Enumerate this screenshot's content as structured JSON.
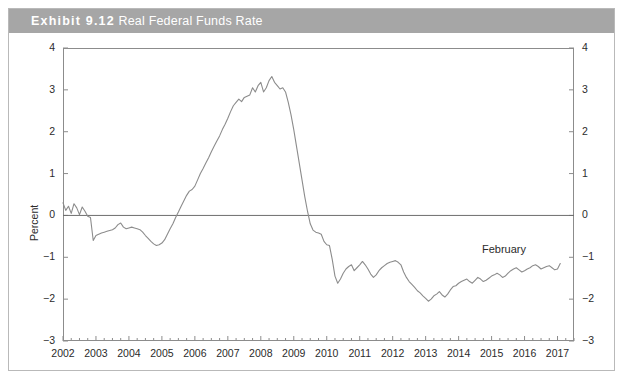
{
  "figure": {
    "exhibit_number": "Exhibit 9.12",
    "exhibit_title": "Real Federal Funds Rate",
    "border_color": "#b9b9b9",
    "title_bar_color": "#a6a6a6",
    "title_text_color": "#ffffff"
  },
  "annotations": {
    "february": "February"
  },
  "chart_data": {
    "type": "line",
    "title": "Real Federal Funds Rate",
    "xlabel": "",
    "ylabel": "Percent",
    "xlim": [
      2002.0,
      2017.5
    ],
    "ylim": [
      -3,
      4
    ],
    "yticks": [
      -3,
      -2,
      -1,
      0,
      1,
      2,
      3,
      4
    ],
    "ytick_labels": [
      "−3",
      "−2",
      "−1",
      "0",
      "1",
      "2",
      "3",
      "4"
    ],
    "xticks": [
      2002,
      2003,
      2004,
      2005,
      2006,
      2007,
      2008,
      2009,
      2010,
      2011,
      2012,
      2013,
      2014,
      2015,
      2016,
      2017
    ],
    "xtick_labels": [
      "2002",
      "2003",
      "2004",
      "2005",
      "2006",
      "2007",
      "2008",
      "2009",
      "2010",
      "2011",
      "2012",
      "2013",
      "2014",
      "2015",
      "2016",
      "2017"
    ],
    "minor_xticks_per_year": 4,
    "grid": false,
    "legend": false,
    "zero_line": 0,
    "line_color": "#8c8c8c",
    "line_width": 1.1,
    "axis_color": "#8c8c8c",
    "series": [
      {
        "name": "Real Federal Funds Rate",
        "x_start": 2002.0,
        "x_step": 0.08333,
        "values": [
          0.3,
          0.12,
          0.22,
          0.05,
          0.28,
          0.18,
          0.02,
          0.2,
          0.1,
          -0.02,
          -0.05,
          -0.6,
          -0.48,
          -0.45,
          -0.42,
          -0.4,
          -0.38,
          -0.36,
          -0.34,
          -0.3,
          -0.22,
          -0.18,
          -0.28,
          -0.32,
          -0.3,
          -0.28,
          -0.3,
          -0.32,
          -0.34,
          -0.4,
          -0.48,
          -0.55,
          -0.62,
          -0.68,
          -0.72,
          -0.7,
          -0.66,
          -0.58,
          -0.45,
          -0.32,
          -0.2,
          -0.05,
          0.08,
          0.22,
          0.35,
          0.48,
          0.58,
          0.62,
          0.7,
          0.85,
          1.0,
          1.12,
          1.25,
          1.38,
          1.52,
          1.65,
          1.78,
          1.9,
          2.05,
          2.18,
          2.32,
          2.48,
          2.62,
          2.7,
          2.78,
          2.72,
          2.82,
          2.85,
          2.88,
          3.05,
          2.95,
          3.1,
          3.18,
          2.95,
          3.05,
          3.22,
          3.32,
          3.18,
          3.1,
          3.02,
          3.05,
          2.95,
          2.7,
          2.4,
          2.05,
          1.65,
          1.25,
          0.85,
          0.45,
          0.1,
          -0.2,
          -0.35,
          -0.4,
          -0.42,
          -0.45,
          -0.62,
          -0.7,
          -0.72,
          -1.05,
          -1.45,
          -1.62,
          -1.52,
          -1.38,
          -1.28,
          -1.22,
          -1.18,
          -1.32,
          -1.25,
          -1.18,
          -1.1,
          -1.18,
          -1.28,
          -1.4,
          -1.48,
          -1.42,
          -1.32,
          -1.25,
          -1.2,
          -1.15,
          -1.12,
          -1.1,
          -1.08,
          -1.12,
          -1.18,
          -1.35,
          -1.48,
          -1.58,
          -1.65,
          -1.72,
          -1.8,
          -1.85,
          -1.92,
          -1.98,
          -2.05,
          -2.0,
          -1.92,
          -1.88,
          -1.82,
          -1.9,
          -1.95,
          -1.88,
          -1.78,
          -1.7,
          -1.68,
          -1.62,
          -1.58,
          -1.55,
          -1.52,
          -1.58,
          -1.62,
          -1.55,
          -1.48,
          -1.52,
          -1.58,
          -1.55,
          -1.5,
          -1.45,
          -1.42,
          -1.38,
          -1.42,
          -1.48,
          -1.45,
          -1.38,
          -1.32,
          -1.28,
          -1.25,
          -1.3,
          -1.35,
          -1.32,
          -1.28,
          -1.25,
          -1.2,
          -1.18,
          -1.22,
          -1.28,
          -1.25,
          -1.22,
          -1.2,
          -1.25,
          -1.3,
          -1.28,
          -1.15
        ]
      }
    ]
  }
}
